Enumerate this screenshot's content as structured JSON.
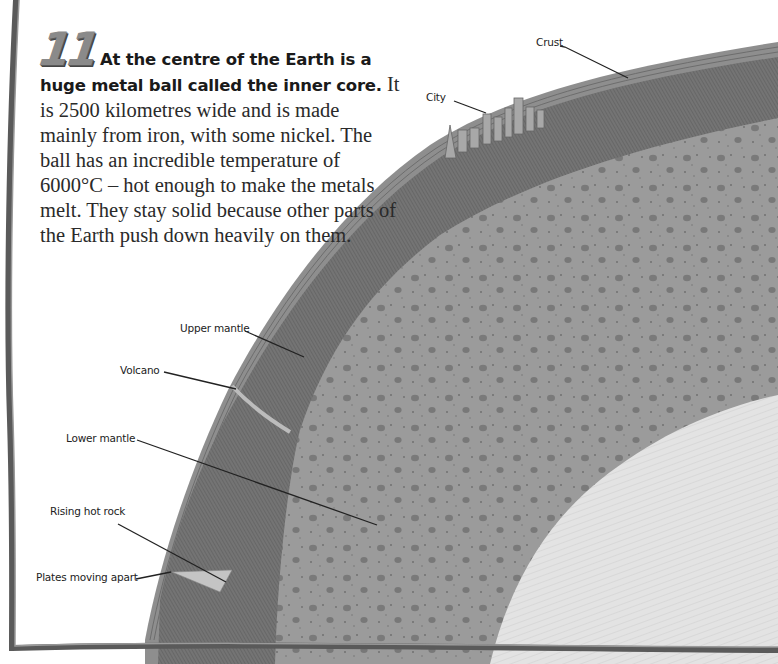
{
  "fact": {
    "number": "11",
    "lead": "At the centre of the Earth is a huge metal ball called the inner core.",
    "body": "It is 2500 kilometres wide and is made mainly from iron, with some nickel. The ball has an incredible temperature of 6000°C – hot enough to make the metals melt. They stay solid because other parts of the Earth push down heavily on them."
  },
  "labels": {
    "crust": "Crust",
    "city": "City",
    "upper_mantle": "Upper mantle",
    "volcano": "Volcano",
    "lower_mantle": "Lower mantle",
    "rising_hot_rock": "Rising hot rock",
    "plates_moving_apart": "Plates moving apart"
  },
  "colors": {
    "crust": "#8c8c8c",
    "upper_mantle": "#727272",
    "lower_mantle": "#9a9a9a",
    "inner_core": "#e2e2e2",
    "frame": "#555555"
  }
}
